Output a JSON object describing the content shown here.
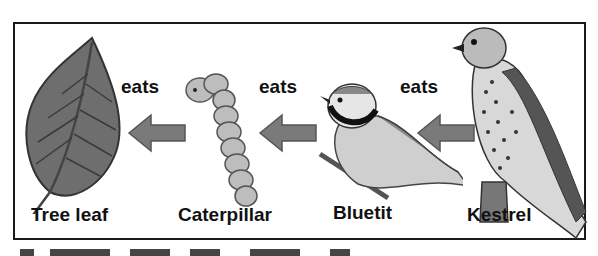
{
  "diagram": {
    "type": "food-chain",
    "relation_label": "eats",
    "organisms": [
      {
        "id": "tree-leaf",
        "label": "Tree leaf"
      },
      {
        "id": "caterpillar",
        "label": "Caterpillar"
      },
      {
        "id": "bluetit",
        "label": "Bluetit"
      },
      {
        "id": "kestrel",
        "label": "Kestrel"
      }
    ],
    "arrows": [
      {
        "from": "caterpillar",
        "to": "tree-leaf",
        "label": "eats"
      },
      {
        "from": "bluetit",
        "to": "caterpillar",
        "label": "eats"
      },
      {
        "from": "kestrel",
        "to": "bluetit",
        "label": "eats"
      }
    ],
    "colors": {
      "border": "#1a1a1a",
      "arrow": "#7a7a7a",
      "text": "#111111"
    }
  }
}
